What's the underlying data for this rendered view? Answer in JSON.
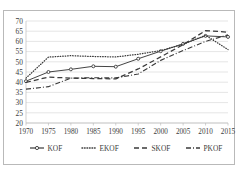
{
  "chart_data": {
    "type": "line",
    "title": "",
    "xlabel": "",
    "ylabel": "",
    "x": [
      1970,
      1975,
      1980,
      1985,
      1990,
      1995,
      2000,
      2005,
      2010,
      2015
    ],
    "categories": [
      "1970",
      "1975",
      "1980",
      "1985",
      "1990",
      "1995",
      "2000",
      "2005",
      "2010",
      "2015"
    ],
    "xtick_labels": [
      "1970",
      "1975",
      "1980",
      "1985",
      "1990",
      "1995",
      "2000",
      "2005",
      "2010",
      "2015"
    ],
    "ytick_labels": [
      "20",
      "25",
      "30",
      "35",
      "40",
      "45",
      "50",
      "55",
      "60",
      "65",
      "70"
    ],
    "ylim": [
      20,
      70
    ],
    "xlim": [
      1970,
      2015
    ],
    "grid": true,
    "legend_position": "bottom",
    "series": [
      {
        "name": "KOF",
        "style": "solid-with-markers",
        "values": [
          40.5,
          45.0,
          46.3,
          47.8,
          47.6,
          51.5,
          55.2,
          58.8,
          62.7,
          62.2
        ]
      },
      {
        "name": "EKOF",
        "style": "dotted",
        "values": [
          42.0,
          52.3,
          53.0,
          52.6,
          52.4,
          53.7,
          55.5,
          58.6,
          63.0,
          56.0
        ]
      },
      {
        "name": "SKOF",
        "style": "dashed",
        "values": [
          39.9,
          42.5,
          42.0,
          41.8,
          41.6,
          46.5,
          52.4,
          58.4,
          65.3,
          64.5
        ]
      },
      {
        "name": "PKOF",
        "style": "dash-dot",
        "values": [
          36.6,
          37.8,
          42.0,
          42.2,
          42.1,
          44.0,
          50.7,
          55.5,
          60.0,
          63.2
        ]
      }
    ]
  },
  "legend": {
    "items": [
      {
        "label": "KOF",
        "marker": "solid-line-with-dot"
      },
      {
        "label": "EKOF",
        "marker": "dotted-line"
      },
      {
        "label": "SKOF",
        "marker": "dashed-line"
      },
      {
        "label": "PKOF",
        "marker": "dash-dot-line"
      }
    ]
  },
  "caption": {
    "text": ""
  },
  "colors": {
    "line": "#3a3a3a",
    "grid": "#d4d4d4",
    "frame": "#b9b9b9",
    "text": "#3c3c3c"
  }
}
